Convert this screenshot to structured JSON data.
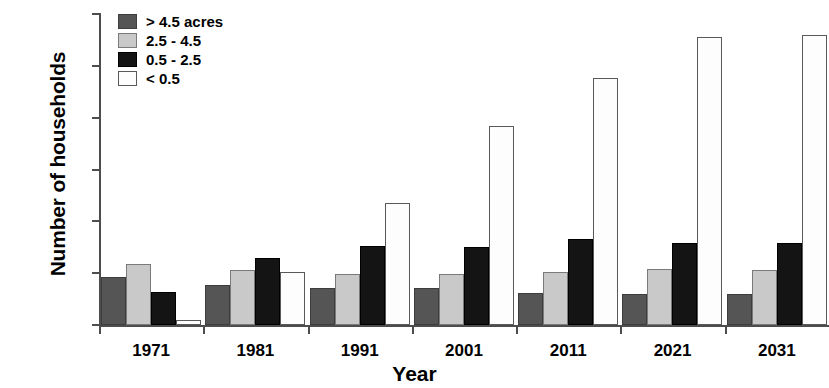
{
  "chart_data": {
    "type": "bar",
    "title": "",
    "xlabel": "Year",
    "ylabel": "Number of households",
    "categories": [
      "1971",
      "1981",
      "1991",
      "2001",
      "2011",
      "2021",
      "2031"
    ],
    "ylim": [
      0,
      3000
    ],
    "ytick_values": [
      0,
      500,
      1000,
      1500,
      2000,
      2500,
      3000
    ],
    "ytick_labels": [
      "0",
      "500",
      "1000",
      "1500",
      "2000",
      "2500",
      "3000"
    ],
    "grid": false,
    "legend_position": "top-left",
    "series": [
      {
        "name": "> 4.5 acres",
        "color": "#555555",
        "values": [
          465,
          385,
          355,
          355,
          305,
          300,
          295
        ]
      },
      {
        "name": "2.5 - 4.5",
        "color": "#c9c9c9",
        "values": [
          590,
          535,
          490,
          490,
          510,
          540,
          535
        ]
      },
      {
        "name": "0.5 - 2.5",
        "color": "#141414",
        "values": [
          320,
          645,
          765,
          750,
          825,
          790,
          790
        ]
      },
      {
        "name": "< 0.5",
        "color": "#fdfdfd",
        "values": [
          45,
          515,
          1175,
          1915,
          2385,
          2775,
          2800
        ]
      }
    ]
  },
  "legend": {
    "items": [
      {
        "label": "> 4.5 acres"
      },
      {
        "label": "2.5 - 4.5"
      },
      {
        "label": "0.5 - 2.5"
      },
      {
        "label": "< 0.5"
      }
    ]
  }
}
